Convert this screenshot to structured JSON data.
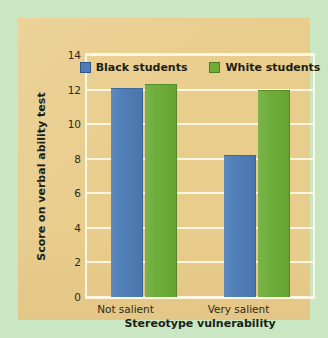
{
  "chart_data": {
    "type": "bar",
    "title": "",
    "xlabel": "Stereotype vulnerability",
    "ylabel": "Score on verbal ability test",
    "categories": [
      "Not salient",
      "Very salient"
    ],
    "series": [
      {
        "name": "Black students",
        "color": "#4d7cb6",
        "values": [
          12.1,
          8.2
        ]
      },
      {
        "name": "White students",
        "color": "#6cac37",
        "values": [
          12.3,
          12.0
        ]
      }
    ],
    "ylim": [
      0,
      14
    ],
    "yticks": [
      0,
      2,
      4,
      6,
      8,
      10,
      12,
      14
    ],
    "ytick_labels": [
      "0",
      "2",
      "4",
      "6",
      "8",
      "10",
      "12",
      "14"
    ],
    "grid": true,
    "legend_position": "top-center"
  },
  "colors": {
    "outer_background": "#c9e7c2",
    "panel_background": "#e9cd8d",
    "gridline": "#fdf6e2",
    "axis_frame": "#fdf6e2",
    "text": "#1d1d14",
    "series_blue": "#4d7cb6",
    "series_green": "#6cac37"
  }
}
